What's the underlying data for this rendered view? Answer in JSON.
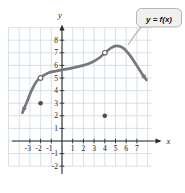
{
  "figure": {
    "callout": {
      "text": "y = f(x)"
    },
    "axis_letters": {
      "x": "x",
      "y": "y"
    }
  },
  "chart_data": {
    "type": "line",
    "title": "y = f(x)",
    "xlabel": "x",
    "ylabel": "y",
    "grid": true,
    "xlim": [
      -5,
      8.6
    ],
    "ylim": [
      -2.9,
      9.3
    ],
    "x_ticks": [
      -3,
      -2,
      -1,
      1,
      2,
      3,
      4,
      5,
      6,
      7
    ],
    "y_ticks": [
      -2,
      -1,
      1,
      2,
      3,
      4,
      5,
      6,
      7,
      8
    ],
    "grid_x_lines": [
      -5,
      -4,
      -3,
      -2,
      -1,
      0,
      1,
      2,
      3,
      4,
      5,
      6,
      7,
      8
    ],
    "grid_y_lines": [
      -2,
      -1,
      0,
      1,
      2,
      3,
      4,
      5,
      6,
      7,
      8,
      9
    ],
    "curve_points": [
      [
        -3.7,
        2.25
      ],
      [
        -3.3,
        3.05
      ],
      [
        -2.85,
        4.0
      ],
      [
        -2.4,
        4.7
      ],
      [
        -2,
        5.05
      ],
      [
        -1.3,
        5.4
      ],
      [
        -0.6,
        5.55
      ],
      [
        0,
        5.65
      ],
      [
        1,
        5.8
      ],
      [
        2,
        6.0
      ],
      [
        2.8,
        6.25
      ],
      [
        3.5,
        6.6
      ],
      [
        4,
        7.0
      ],
      [
        4.6,
        7.4
      ],
      [
        5.1,
        7.55
      ],
      [
        5.7,
        7.4
      ],
      [
        6.3,
        6.85
      ],
      [
        6.9,
        6.1
      ],
      [
        7.5,
        5.3
      ],
      [
        7.9,
        4.85
      ]
    ],
    "open_points": [
      [
        -2,
        5
      ],
      [
        4,
        7
      ]
    ],
    "closed_points": [
      [
        -2,
        3
      ],
      [
        4,
        2
      ]
    ],
    "arrows": "both_ends",
    "colors": {
      "background": "#ffffff",
      "grid": "#ccd9e4",
      "axis": "#2b2b2b",
      "tick_label": "#222222",
      "curve": "#77777c",
      "point": "#4d4d52",
      "open_point_stroke": "#6a6a6f",
      "callout_bg": "#f0f0ee",
      "callout_border": "#b5b5b2",
      "callout_text": "#111111"
    }
  }
}
